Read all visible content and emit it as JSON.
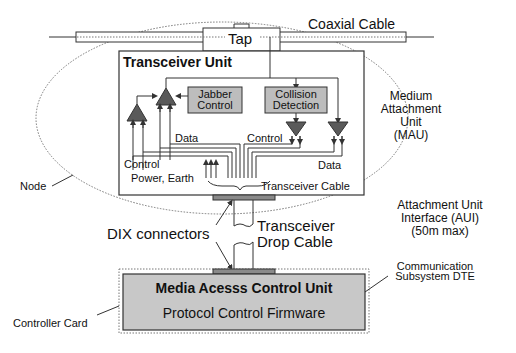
{
  "diagram": {
    "type": "ethernet-node-architecture",
    "colors": {
      "line": "#333333",
      "box_fill": "#bdbdbd",
      "amp_fill": "#5a5a5a",
      "mac_fill": "#c8c8c8",
      "connector_fill": "#8a8a8a",
      "ellipse_dots": "#777777"
    }
  },
  "labels": {
    "coaxial_cable": "Coaxial Cable",
    "tap": "Tap",
    "transceiver_unit": "Transceiver Unit",
    "jabber_control_1": "Jabber",
    "jabber_control_2": "Control",
    "collision_detection_1": "Collision",
    "collision_detection_2": "Detection",
    "data_left": "Data",
    "control_right": "Control",
    "control_left": "Control",
    "data_right": "Data",
    "power_earth": "Power, Earth",
    "transceiver_cable": "Transceiver Cable",
    "mau_1": "Medium",
    "mau_2": "Attachment",
    "mau_3": "Unit",
    "mau_4": "(MAU)",
    "node": "Node",
    "dix_connectors": "DIX connectors",
    "drop_cable_1": "Transceiver",
    "drop_cable_2": "Drop Cable",
    "aui_1": "Attachment Unit",
    "aui_2": "Interface (AUI)",
    "aui_3": "(50m max)",
    "comm_dte_1": "Communication",
    "comm_dte_2": "Subsystem DTE",
    "mac_unit": "Media Acesss Control Unit",
    "protocol_firmware": "Protocol Control Firmware",
    "controller_card": "Controller Card"
  }
}
